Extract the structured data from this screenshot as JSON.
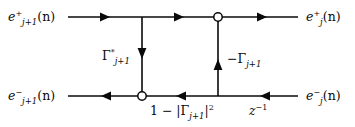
{
  "figure": {
    "background_color": "#ffffff",
    "line_color": "#0a0a0a",
    "node_fill_color": "#ffffff"
  },
  "labels": {
    "e_plus_in": {
      "base": "e",
      "superscript": "+",
      "subscript": "j+1",
      "argument": "(n)",
      "text": "e+j+1(n)"
    },
    "e_minus_in": {
      "base": "e",
      "superscript": "−",
      "subscript": "j+1",
      "argument": "(n)",
      "text": "e−j+1(n)"
    },
    "e_plus_out": {
      "base": "e",
      "superscript": "+",
      "subscript": "j",
      "argument": "(n)",
      "text": "e+j(n)"
    },
    "e_minus_out": {
      "base": "e",
      "superscript": "−",
      "subscript": "j",
      "argument": "(n)",
      "text": "e−j(n)"
    },
    "gain_left": {
      "symbol": "Γ",
      "superscript": "*",
      "subscript": "j+1",
      "text": "Γ*j+1"
    },
    "gain_right": {
      "sign": "−",
      "symbol": "Γ",
      "subscript": "j+1",
      "text": "−Γj+1"
    },
    "reflection_term": {
      "text": "1 − |Γj+1|²",
      "prefix": "1 − |",
      "symbol": "Γ",
      "subscript": "j+1",
      "suffix": "|",
      "exponent": "2"
    },
    "delay": {
      "base": "z",
      "exponent": "−1",
      "text": "z−1"
    }
  },
  "graph": {
    "lines": [
      {
        "name": "top-forward-path",
        "x1": 68,
        "y1": 17,
        "x2": 298,
        "y2": 17,
        "direction": "left-to-right"
      },
      {
        "name": "bottom-backward-path",
        "x1": 68,
        "y1": 96,
        "x2": 298,
        "y2": 96,
        "direction": "right-to-left"
      },
      {
        "name": "left-cross-branch",
        "x1": 142,
        "y1": 17,
        "x2": 142,
        "y2": 96,
        "direction": "down"
      },
      {
        "name": "right-cross-branch",
        "x1": 218,
        "y1": 96,
        "x2": 218,
        "y2": 17,
        "direction": "up"
      }
    ],
    "arrowheads": [
      {
        "name": "top-arrow-1",
        "x": 108,
        "y": 17,
        "direction": "right"
      },
      {
        "name": "top-arrow-2",
        "x": 182,
        "y": 17,
        "direction": "right"
      },
      {
        "name": "top-arrow-3",
        "x": 265,
        "y": 17,
        "direction": "right"
      },
      {
        "name": "bottom-arrow-1",
        "x": 103,
        "y": 96,
        "direction": "left"
      },
      {
        "name": "bottom-arrow-2",
        "x": 178,
        "y": 96,
        "direction": "left"
      },
      {
        "name": "bottom-arrow-3",
        "x": 262,
        "y": 96,
        "direction": "left"
      },
      {
        "name": "left-branch-arrow",
        "x": 142,
        "y": 58,
        "direction": "down"
      },
      {
        "name": "right-branch-arrow",
        "x": 218,
        "y": 60,
        "direction": "up"
      }
    ],
    "nodes": [
      {
        "name": "summing-node-top",
        "x": 218,
        "y": 17,
        "radius": 4.2
      },
      {
        "name": "summing-node-bottom",
        "x": 142,
        "y": 96,
        "radius": 4.2
      }
    ]
  }
}
